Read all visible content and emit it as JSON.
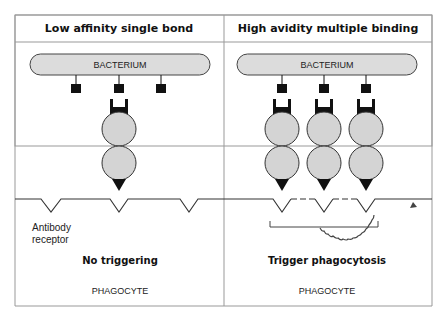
{
  "panels": [
    {
      "title": "Low affinity single bond",
      "bacterium_label": "BACTERIUM",
      "receptor_label_line1": "Antibody",
      "receptor_label_line2": "receptor",
      "outcome": "No triggering",
      "cell_label": "PHAGOCYTE"
    },
    {
      "title": "High avidity multiple binding",
      "bacterium_label": "BACTERIUM",
      "outcome": "Trigger phagocytosis",
      "cell_label": "PHAGOCYTE"
    }
  ],
  "colors": {
    "border": "#888888",
    "fill": "#d9d9d9",
    "ink": "#111111"
  }
}
